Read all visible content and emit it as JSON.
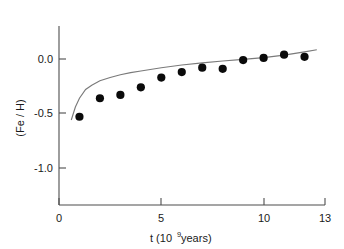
{
  "chart_data": {
    "type": "scatter",
    "title": "",
    "subtitle": "",
    "xlabel": "t (10⁹ years)",
    "xlabel_base": "t (10",
    "xlabel_exponent": "9",
    "xlabel_tail": " years)",
    "ylabel": "(Fe / H)",
    "xlim": [
      0,
      13
    ],
    "ylim": [
      -1.35,
      0.22
    ],
    "grid": false,
    "legend": null,
    "xticks": [
      0,
      5,
      10,
      13
    ],
    "xticklabels": [
      "0",
      "5",
      "10",
      "13"
    ],
    "yticks": [
      0.0,
      -0.5,
      -1.0
    ],
    "yticklabels": [
      "0.0",
      "-0.5",
      "-1.0"
    ],
    "series": [
      {
        "name": "observations",
        "type": "scatter",
        "marker": "filled-circle",
        "color": "#0a0a0a",
        "x": [
          1,
          2,
          3,
          4,
          5,
          6,
          7,
          8,
          9,
          10,
          11,
          12
        ],
        "y": [
          -0.53,
          -0.36,
          -0.33,
          -0.26,
          -0.17,
          -0.12,
          -0.08,
          -0.09,
          -0.01,
          0.01,
          0.04,
          0.02
        ]
      },
      {
        "name": "model",
        "type": "line",
        "color": "#7a7a7a",
        "x": [
          0.6,
          0.8,
          1.0,
          1.3,
          1.6,
          2.0,
          2.5,
          3.0,
          3.5,
          4.0,
          5.0,
          6.0,
          7.0,
          8.0,
          9.0,
          10.0,
          11.0,
          12.0,
          12.6
        ],
        "y": [
          -0.56,
          -0.44,
          -0.36,
          -0.28,
          -0.24,
          -0.2,
          -0.17,
          -0.145,
          -0.125,
          -0.11,
          -0.08,
          -0.055,
          -0.035,
          -0.018,
          -0.003,
          0.012,
          0.035,
          0.065,
          0.085
        ]
      }
    ]
  }
}
